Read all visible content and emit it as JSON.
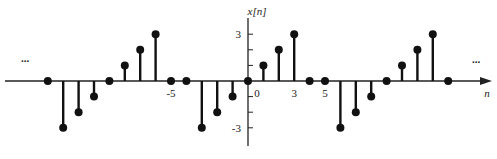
{
  "chart_data": {
    "type": "stem",
    "title": "",
    "xlabel": "n",
    "ylabel": "x[n]",
    "x": [
      -13,
      -12,
      -11,
      -10,
      -9,
      -8,
      -7,
      -6,
      -5,
      -4,
      -3,
      -2,
      -1,
      0,
      1,
      2,
      3,
      4,
      5,
      6,
      7,
      8,
      9,
      10,
      11,
      12,
      13
    ],
    "values": [
      0,
      -3,
      -2,
      -1,
      0,
      1,
      2,
      3,
      0,
      0,
      -3,
      -2,
      -1,
      0,
      1,
      2,
      3,
      0,
      0,
      -3,
      -2,
      -1,
      0,
      1,
      2,
      3,
      0
    ],
    "period": 12,
    "x_tick_labels": [
      {
        "n": -5,
        "label": "-5"
      },
      {
        "n": 0,
        "label": "0"
      },
      {
        "n": 3,
        "label": "3"
      },
      {
        "n": 5,
        "label": "5"
      }
    ],
    "y_tick_labels": [
      {
        "v": 3,
        "label": "3"
      },
      {
        "v": -3,
        "label": "-3"
      }
    ],
    "y_ticks": [
      3,
      2,
      1,
      -1,
      -2,
      -3
    ],
    "ylim": [
      -3.5,
      3.5
    ],
    "continuation_marks": "...",
    "grid": false,
    "legend": null
  }
}
